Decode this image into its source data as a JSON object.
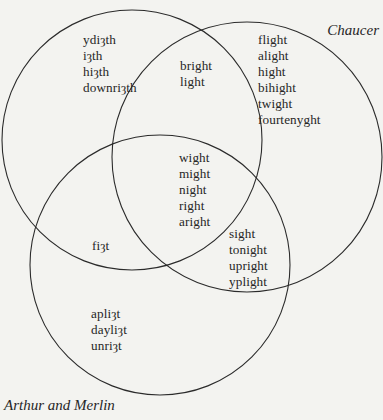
{
  "diagram": {
    "type": "venn",
    "sets": [
      {
        "id": "a",
        "label": "",
        "cx": 132,
        "cy": 140,
        "r": 130
      },
      {
        "id": "chaucer",
        "label": "Chaucer",
        "cx": 247,
        "cy": 157,
        "r": 135
      },
      {
        "id": "arthur",
        "label": "Arthur and Merlin",
        "cx": 160,
        "cy": 265,
        "r": 130
      }
    ],
    "regions": {
      "a_only": [
        "ydiȝth",
        "iȝth",
        "hiȝth",
        "downriȝth"
      ],
      "a_chaucer": [
        "bright",
        "light"
      ],
      "chaucer_only": [
        "flight",
        "alight",
        "hight",
        "bihight",
        "twight",
        "fourtenyght"
      ],
      "all_three": [
        "wight",
        "might",
        "night",
        "right",
        "aright"
      ],
      "a_arthur": [
        "fiȝt"
      ],
      "chaucer_arthur": [
        "sight",
        "tonight",
        "upright",
        "yplight"
      ],
      "arthur_only": [
        "apliȝt",
        "dayliȝt",
        "unriȝt"
      ]
    },
    "stroke_color": "#2b2b2b",
    "background_color": "#f3f3f0",
    "text_color": "#262626"
  }
}
